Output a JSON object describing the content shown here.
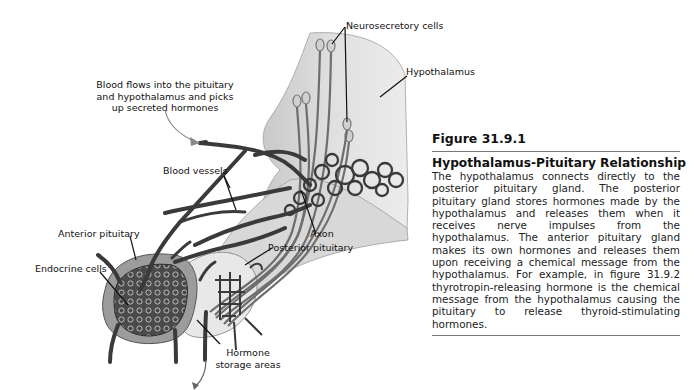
{
  "diagram": {
    "labels": {
      "neurosecretory_cells": "Neurosecretory cells",
      "hypothalamus": "Hypothalamus",
      "blood_flow_line1": "Blood flows into the pituitary",
      "blood_flow_line2": "and hypothalamus and picks",
      "blood_flow_line3": "up secreted hormones",
      "blood_vessels": "Blood vessels",
      "anterior_pituitary": "Anterior pituitary",
      "axon": "Axon",
      "posterior_pituitary": "Posterior pituitary",
      "endocrine_cells": "Endocrine cells",
      "hormone_storage_line1": "Hormone",
      "hormone_storage_line2": "storage areas"
    },
    "colors": {
      "hypothalamus_fill": "#dcdcdc",
      "vessel_stroke": "#3a3a3a",
      "anterior_fill": "#9a9a9a",
      "posterior_fill": "#e6e6e6",
      "arrow": "#7a7a7a"
    }
  },
  "caption": {
    "figure_number": "Figure 31.9.1",
    "title": "Hypothalamus-Pituitary Relationship",
    "body": "The hypothalamus connects directly to the posterior pituitary gland. The posterior pituitary gland stores hormones made by the hypothalamus and releases them when it receives nerve impulses from the hypothalamus. The anterior pituitary gland makes its own hormones and releases them upon receiving a chemical message from the hypothalamus. For example, in figure 31.9.2 thyrotropin-releasing hormone is the chemical message from the hypothalamus causing the pituitary to release thyroid-stimulating hormones."
  }
}
